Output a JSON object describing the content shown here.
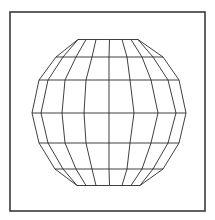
{
  "figure": {
    "frame": {
      "x": 10,
      "y": 12,
      "width": 195,
      "height": 199,
      "stroke": "#3a3a3a"
    },
    "line_color": "#2a2a2a",
    "background": "#ffffff"
  },
  "sphere": {
    "rows": [
      {
        "y": 39.5,
        "x": [
          78,
          78,
          86,
          96,
          109.5,
          122,
          131,
          138,
          138
        ]
      },
      {
        "y": 57,
        "x": [
          56,
          63,
          76,
          92,
          109,
          127,
          142,
          153,
          163
        ]
      },
      {
        "y": 80,
        "x": [
          39,
          48,
          65,
          86,
          109,
          130,
          151,
          168,
          179
        ]
      },
      {
        "y": 113,
        "x": [
          32,
          41,
          62,
          84,
          109,
          134,
          158,
          176,
          186
        ]
      },
      {
        "y": 143,
        "x": [
          39,
          48,
          65,
          86,
          109,
          130,
          151,
          168,
          179
        ]
      },
      {
        "y": 169,
        "x": [
          55,
          63,
          76,
          92,
          109,
          127,
          142,
          153,
          163
        ]
      },
      {
        "y": 185.5,
        "x": [
          77,
          77,
          86,
          96,
          109.5,
          122,
          131,
          140,
          140
        ]
      }
    ]
  }
}
